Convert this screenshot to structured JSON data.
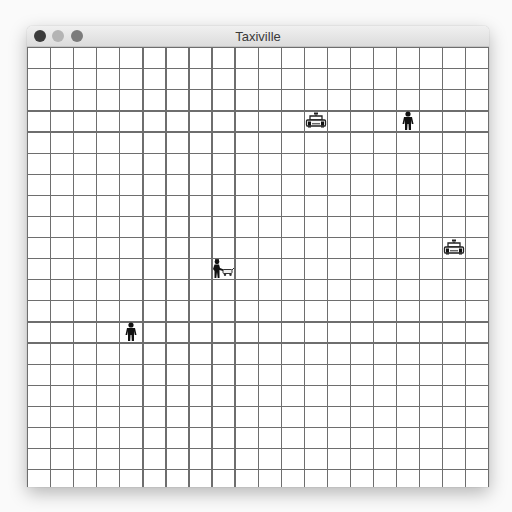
{
  "window": {
    "title": "Taxiville",
    "controls": [
      {
        "name": "close",
        "color": "#3c3c3c"
      },
      {
        "name": "minimize",
        "color": "#b4b4b4"
      },
      {
        "name": "zoom",
        "color": "#7c7c7c"
      }
    ]
  },
  "board": {
    "columns": 20,
    "rows": 21,
    "cell_width": 23.05,
    "cell_height": 21.1,
    "line_color": "#6e6e6e",
    "entities": [
      {
        "type": "taxi",
        "icon": "taxi-icon",
        "col": 12,
        "row": 3
      },
      {
        "type": "passenger",
        "icon": "person-icon",
        "col": 16,
        "row": 3
      },
      {
        "type": "taxi",
        "icon": "taxi-icon",
        "col": 18,
        "row": 9
      },
      {
        "type": "passenger-with-luggage",
        "icon": "person-with-luggage-icon",
        "col": 8,
        "row": 10
      },
      {
        "type": "passenger",
        "icon": "person-icon",
        "col": 4,
        "row": 13
      }
    ]
  }
}
